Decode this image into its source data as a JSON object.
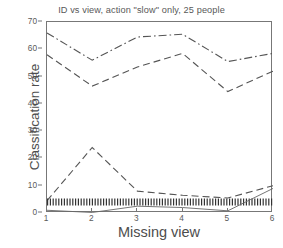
{
  "chart_data": {
    "type": "line",
    "title": "ID vs view, action \"slow\" only, 25 people",
    "xlabel": "Missing view",
    "ylabel": "Classification rate",
    "xlim": [
      1,
      6
    ],
    "ylim": [
      0,
      70
    ],
    "xticks": [
      1,
      2,
      3,
      4,
      5,
      6
    ],
    "yticks": [
      0,
      10,
      20,
      30,
      40,
      50,
      60,
      70
    ],
    "grid": false,
    "legend": "none",
    "x": [
      1,
      2,
      3,
      4,
      5,
      6
    ],
    "series": [
      {
        "name": "dashdot-upper",
        "style": "dashdot",
        "color": "#555555",
        "values": [
          66.0,
          56.0,
          64.5,
          65.5,
          55.5,
          58.5
        ]
      },
      {
        "name": "dashed-upper",
        "style": "dashed",
        "color": "#555555",
        "values": [
          58.0,
          46.5,
          53.5,
          58.5,
          44.5,
          52.0
        ]
      },
      {
        "name": "dashed-lower-bump",
        "style": "dashed",
        "color": "#555555",
        "values": [
          4.5,
          24.0,
          8.0,
          6.5,
          5.5,
          10.0
        ]
      },
      {
        "name": "dotted-baseline",
        "style": "dotted",
        "color": "#333333",
        "values": [
          4.0,
          4.0,
          4.0,
          4.0,
          4.0,
          4.0
        ]
      },
      {
        "name": "solid-baseline",
        "style": "solid",
        "color": "#666666",
        "values": [
          1.0,
          0.2,
          2.5,
          2.0,
          0.8,
          9.0
        ]
      }
    ]
  },
  "axis": {
    "y_ticklabels": [
      "0",
      "10",
      "20",
      "30",
      "40",
      "50",
      "60",
      "70"
    ],
    "x_ticklabels": [
      "1",
      "2",
      "3",
      "4",
      "5",
      "6"
    ]
  }
}
